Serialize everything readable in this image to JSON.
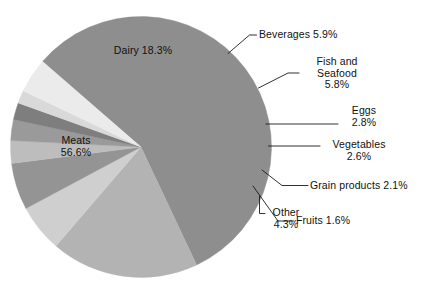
{
  "chart_data": {
    "type": "pie",
    "title": "",
    "subtitle": "",
    "xlabel": "",
    "ylabel": "",
    "legend_position": "none",
    "grid": false,
    "units": "percent",
    "categories": [
      "Meats",
      "Dairy",
      "Beverages",
      "Fish and Seafood",
      "Eggs",
      "Vegetables",
      "Grain products",
      "Fruits",
      "Other"
    ],
    "values": [
      56.6,
      18.3,
      5.9,
      5.8,
      2.8,
      2.6,
      2.1,
      1.6,
      4.3
    ],
    "slices": [
      {
        "name": "Meats",
        "value": 56.6,
        "label": "Meats",
        "value_label": "56.6%",
        "color": "#8e8e8e",
        "label_placement": "inside"
      },
      {
        "name": "Dairy",
        "value": 18.3,
        "label": "Dairy",
        "value_label": "18.3%",
        "color": "#b3b3b3",
        "label_placement": "inside"
      },
      {
        "name": "Beverages",
        "value": 5.9,
        "label": "Beverages",
        "value_label": "5.9%",
        "color": "#cfcfcf",
        "label_placement": "outside"
      },
      {
        "name": "Fish and Seafood",
        "value": 5.8,
        "label": "Fish and Seafood",
        "value_label": "5.8%",
        "color": "#949494",
        "label_placement": "outside"
      },
      {
        "name": "Eggs",
        "value": 2.8,
        "label": "Eggs",
        "value_label": "2.8%",
        "color": "#bdbdbd",
        "label_placement": "outside"
      },
      {
        "name": "Vegetables",
        "value": 2.6,
        "label": "Vegetables",
        "value_label": "2.6%",
        "color": "#9a9a9a",
        "label_placement": "outside"
      },
      {
        "name": "Grain products",
        "value": 2.1,
        "label": "Grain products",
        "value_label": "2.1%",
        "color": "#7e7e7e",
        "label_placement": "outside"
      },
      {
        "name": "Fruits",
        "value": 1.6,
        "label": "Fruits",
        "value_label": "1.6%",
        "color": "#d9d9d9",
        "label_placement": "outside"
      },
      {
        "name": "Other",
        "value": 4.3,
        "label": "Other",
        "value_label": "4.3%",
        "color": "#ebebeb",
        "label_placement": "outside"
      }
    ]
  },
  "labels": {
    "meats_line1": "Meats",
    "meats_line2": "56.6%",
    "dairy": "Dairy 18.3%",
    "beverages": "Beverages 5.9%",
    "fish_line1": "Fish and",
    "fish_line2": "Seafood",
    "fish_line3": "5.8%",
    "eggs_line1": "Eggs",
    "eggs_line2": "2.8%",
    "vegetables_line1": "Vegetables",
    "vegetables_line2": "2.6%",
    "grain": "Grain products 2.1%",
    "fruits": "Fruits 1.6%",
    "other_line1": "Other",
    "other_line2": "4.3%"
  },
  "colors": {
    "background": "#ffffff",
    "text": "#111111",
    "leader_line": "#1a1a1a"
  }
}
